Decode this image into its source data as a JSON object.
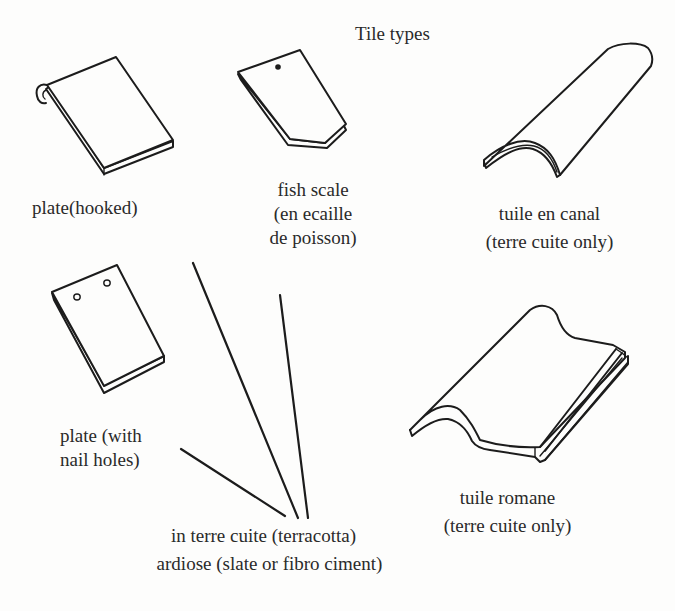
{
  "diagram": {
    "title": "Tile types",
    "tiles": [
      {
        "id": "plate-hooked",
        "lines": [
          "plate(hooked)"
        ]
      },
      {
        "id": "fish-scale",
        "lines": [
          "fish scale",
          "(en ecaille",
          "de poisson)"
        ]
      },
      {
        "id": "tuile-en-canal",
        "lines": [
          "tuile en canal",
          "(terre cuite only)"
        ]
      },
      {
        "id": "plate-nail-holes",
        "lines": [
          "plate (with",
          "nail holes)"
        ]
      },
      {
        "id": "tuile-romane",
        "lines": [
          "tuile romane",
          "(terre cuite only)"
        ]
      }
    ],
    "material_note": {
      "lines": [
        "in terre cuite (terracotta)",
        "ardiose (slate or fibro ciment)"
      ],
      "applies_to": [
        "plate(hooked)",
        "fish scale",
        "plate (with nail holes)"
      ]
    }
  }
}
